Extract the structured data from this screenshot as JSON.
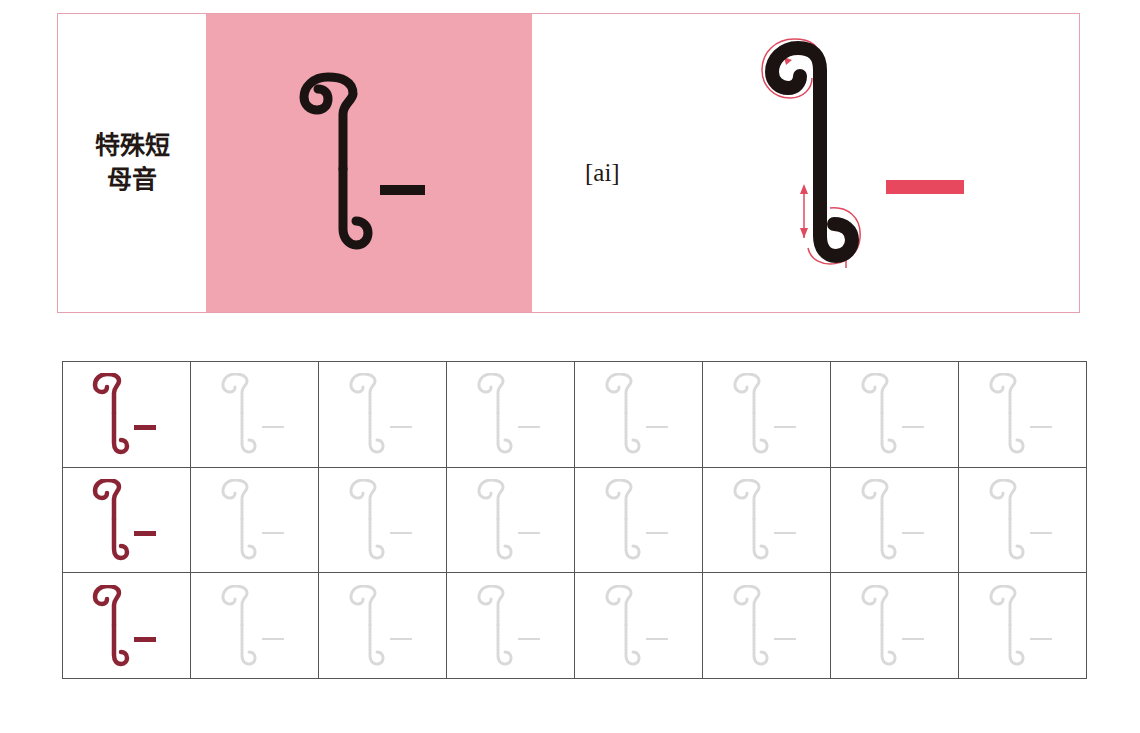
{
  "card": {
    "label_line1": "特殊短",
    "label_line2": "母音",
    "ipa": "[ai]",
    "letter": "ไ",
    "vowel_mark": "–",
    "colors": {
      "border": "#e7a0ad",
      "pink_background": "#f0a5b1",
      "stroke_guide": "#e04a5f",
      "dash_accent": "#e8485d",
      "glyph": "#1a1311"
    }
  },
  "practice_grid": {
    "rows": 3,
    "columns": 8,
    "model_color": "#8b2535",
    "trace_color": "#d9d9d9",
    "cells": [
      [
        "model",
        "trace",
        "trace",
        "trace",
        "trace",
        "trace",
        "trace",
        "trace"
      ],
      [
        "model",
        "trace",
        "trace",
        "trace",
        "trace",
        "trace",
        "trace",
        "trace"
      ],
      [
        "model",
        "trace",
        "trace",
        "trace",
        "trace",
        "trace",
        "trace",
        "trace"
      ]
    ]
  }
}
